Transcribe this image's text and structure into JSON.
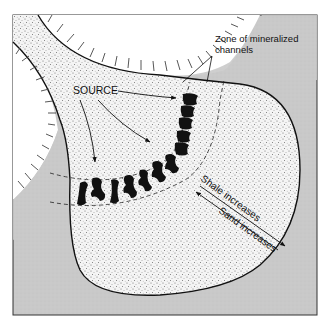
{
  "figure": {
    "type": "geologic-cross-section-plan",
    "colors": {
      "background": "#ffffff",
      "frame": "#333333",
      "bedrock_gray": "#c8c8c8",
      "sand_fill": "#f2f2f2",
      "outline": "#111111",
      "channel": "#111111",
      "hatch": "#444444"
    },
    "labels": {
      "source": "SOURCE",
      "zone_line1": "Zone of mineralized",
      "zone_line2": "channels",
      "shale": "Shale increases",
      "sand": "Sand increases"
    },
    "regions": [
      {
        "name": "sand-body",
        "description": "stippled sandstone deposit fed from upper-left channel"
      },
      {
        "name": "highland-upper",
        "description": "hatched upland, upper middle"
      },
      {
        "name": "highland-left",
        "description": "hatched upland, left"
      },
      {
        "name": "basin-gray",
        "description": "gray surrounding rock"
      }
    ],
    "arrows": [
      {
        "name": "source-arrow-1",
        "meaning": "flow from source toward channels"
      },
      {
        "name": "source-arrow-2",
        "meaning": "flow from source toward channels"
      },
      {
        "name": "source-arrow-3",
        "meaning": "flow from source toward channels"
      },
      {
        "name": "shale-arrow",
        "meaning": "direction shale increases"
      },
      {
        "name": "sand-arrow",
        "meaning": "direction sand increases"
      }
    ]
  }
}
